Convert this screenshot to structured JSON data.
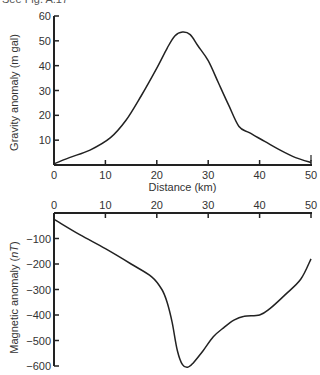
{
  "caption": "See Fig. A.17",
  "chart_data": [
    {
      "type": "line",
      "title": "",
      "xlabel": "Distance (km)",
      "ylabel": "Gravity anomaly (m gal)",
      "xlim": [
        0,
        50
      ],
      "ylim": [
        0,
        60
      ],
      "xticks": [
        "0",
        "10",
        "20",
        "30",
        "40",
        "50"
      ],
      "yticks": [
        "10",
        "20",
        "30",
        "40",
        "50",
        "60"
      ],
      "grid": false,
      "x": [
        0,
        3,
        7,
        11,
        14,
        17,
        20,
        22,
        23.5,
        25,
        26.5,
        28,
        30,
        32,
        34,
        36,
        38,
        41,
        44,
        47,
        50
      ],
      "values": [
        0.5,
        3,
        6,
        11,
        18,
        28,
        39,
        47,
        52,
        53.5,
        52.5,
        48,
        42,
        33,
        24,
        15.5,
        13,
        9.5,
        6,
        3,
        1
      ]
    },
    {
      "type": "line",
      "title": "",
      "xlabel": "",
      "ylabel": "Magnetic anomaly (nT)",
      "xlim": [
        0,
        50
      ],
      "ylim": [
        -600,
        0
      ],
      "xticks": [
        "0",
        "10",
        "20",
        "30",
        "40",
        "50"
      ],
      "yticks": [
        "-100",
        "-200",
        "-300",
        "-400",
        "-500",
        "-600"
      ],
      "grid": false,
      "x": [
        0,
        5,
        10,
        15,
        19,
        21,
        22,
        23,
        24,
        25,
        26,
        27,
        29,
        31,
        33,
        35,
        37,
        40,
        42,
        45,
        48,
        50
      ],
      "values": [
        -25,
        -85,
        -140,
        -200,
        -250,
        -300,
        -350,
        -430,
        -540,
        -595,
        -605,
        -590,
        -540,
        -485,
        -450,
        -420,
        -405,
        -400,
        -375,
        -320,
        -260,
        -180
      ]
    }
  ]
}
